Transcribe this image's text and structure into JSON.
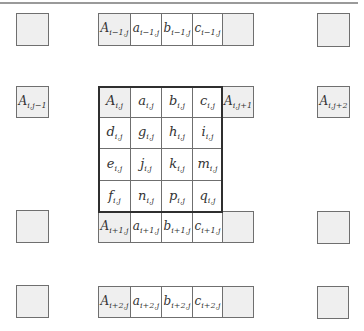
{
  "diagram": {
    "row_i_minus_1": [
      {
        "base": "A",
        "sub": "i−1,j"
      },
      {
        "base": "a",
        "sub": "i−1,j"
      },
      {
        "base": "b",
        "sub": "i−1,j"
      },
      {
        "base": "c",
        "sub": "i−1,j"
      },
      {
        "base": "",
        "sub": ""
      }
    ],
    "left_neighbor": {
      "base": "A",
      "sub": "i,j−1"
    },
    "right_neighbor": {
      "base": "A",
      "sub": "i,j+1"
    },
    "right_far_neighbor": {
      "base": "A",
      "sub": "i,j+2"
    },
    "main_block": [
      [
        {
          "base": "A",
          "sub": "i,j"
        },
        {
          "base": "a",
          "sub": "i,j"
        },
        {
          "base": "b",
          "sub": "i,j"
        },
        {
          "base": "c",
          "sub": "i,j"
        }
      ],
      [
        {
          "base": "d",
          "sub": "i,j"
        },
        {
          "base": "g",
          "sub": "i,j"
        },
        {
          "base": "h",
          "sub": "i,j"
        },
        {
          "base": "i",
          "sub": "i,j"
        }
      ],
      [
        {
          "base": "e",
          "sub": "i,j"
        },
        {
          "base": "j",
          "sub": "i,j"
        },
        {
          "base": "k",
          "sub": "i,j"
        },
        {
          "base": "m",
          "sub": "i,j"
        }
      ],
      [
        {
          "base": "f",
          "sub": "i,j"
        },
        {
          "base": "n",
          "sub": "i,j"
        },
        {
          "base": "p",
          "sub": "i,j"
        },
        {
          "base": "q",
          "sub": "i,j"
        }
      ]
    ],
    "row_i_plus_1": [
      {
        "base": "A",
        "sub": "i+1,j"
      },
      {
        "base": "a",
        "sub": "i+1,j"
      },
      {
        "base": "b",
        "sub": "i+1,j"
      },
      {
        "base": "c",
        "sub": "i+1,j"
      },
      {
        "base": "",
        "sub": ""
      }
    ],
    "row_i_plus_2": [
      {
        "base": "A",
        "sub": "i+2,j"
      },
      {
        "base": "a",
        "sub": "i+2,j"
      },
      {
        "base": "b",
        "sub": "i+2,j"
      },
      {
        "base": "c",
        "sub": "i+2,j"
      },
      {
        "base": "",
        "sub": ""
      }
    ],
    "colors": {
      "shaded_fill": "#efefef",
      "border": "#6f6f6f",
      "main_border": "#2f2f2f",
      "top_rule": "#9a9a9a"
    }
  }
}
